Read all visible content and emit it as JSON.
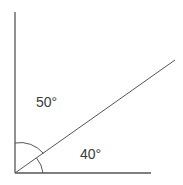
{
  "diagram": {
    "type": "angle-diagram",
    "stroke_color": "#555555",
    "origin": [
      15,
      173
    ],
    "rays": [
      {
        "name": "vertical",
        "to": [
          15,
          12
        ]
      },
      {
        "name": "horizontal",
        "to": [
          151,
          173
        ]
      },
      {
        "name": "diagonal",
        "to": [
          175,
          60
        ]
      }
    ],
    "angles": [
      {
        "name": "upper-angle",
        "label": "50°",
        "between": [
          "vertical",
          "diagonal"
        ]
      },
      {
        "name": "lower-angle",
        "label": "40°",
        "between": [
          "diagonal",
          "horizontal"
        ]
      }
    ]
  }
}
